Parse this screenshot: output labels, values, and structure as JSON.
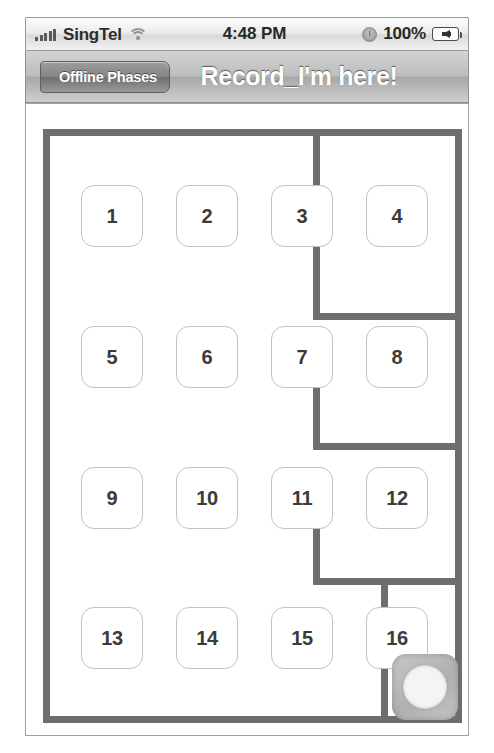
{
  "status_bar": {
    "carrier": "SingTel",
    "signal_icon": "signal-bars-icon",
    "wifi_icon": "wifi-icon",
    "time": "4:48 PM",
    "alarm_icon": "lock-rotation-icon",
    "battery_percent": "100%",
    "battery_icon": "battery-charging-icon"
  },
  "nav_bar": {
    "back_label": "Offline Phases",
    "title": "Record_I'm here!"
  },
  "maze": {
    "colors": {
      "wall": "#6e6e6e",
      "tile_border": "#c2c2c2",
      "tile_text": "#3b3b3b",
      "token_fill": "#b8b8b8",
      "background": "#ffffff"
    },
    "grid": {
      "rows": 4,
      "cols": 4
    },
    "tiles": [
      {
        "label": "1",
        "row": 1,
        "col": 1
      },
      {
        "label": "2",
        "row": 1,
        "col": 2
      },
      {
        "label": "3",
        "row": 1,
        "col": 3
      },
      {
        "label": "4",
        "row": 1,
        "col": 4
      },
      {
        "label": "5",
        "row": 2,
        "col": 1
      },
      {
        "label": "6",
        "row": 2,
        "col": 2
      },
      {
        "label": "7",
        "row": 2,
        "col": 3
      },
      {
        "label": "8",
        "row": 2,
        "col": 4
      },
      {
        "label": "9",
        "row": 3,
        "col": 1
      },
      {
        "label": "10",
        "row": 3,
        "col": 2
      },
      {
        "label": "11",
        "row": 3,
        "col": 3
      },
      {
        "label": "12",
        "row": 3,
        "col": 4
      },
      {
        "label": "13",
        "row": 4,
        "col": 1
      },
      {
        "label": "14",
        "row": 4,
        "col": 2
      },
      {
        "label": "15",
        "row": 4,
        "col": 3
      },
      {
        "label": "16",
        "row": 4,
        "col": 4
      }
    ],
    "token": {
      "name": "player-token",
      "shape": "circle"
    }
  }
}
